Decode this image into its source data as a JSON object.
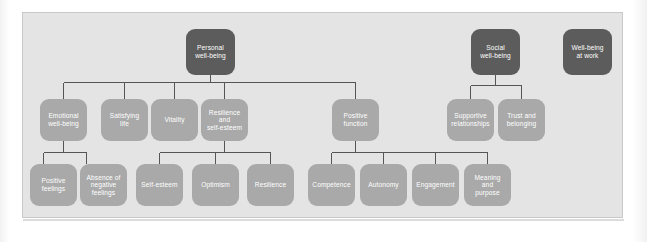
{
  "diagram": {
    "type": "hierarchy-tree",
    "colors": {
      "panel_background": "#e4e4e4",
      "panel_border": "#c9c9c9",
      "node_light": "#a9a9a9",
      "node_dark": "#5c5c5c",
      "node_text": "#ffffff",
      "connector": "#555555",
      "page_background": "#ffffff"
    },
    "nodes": {
      "personal_well_being": "Personal\nwell-being",
      "social_well_being": "Social\nwell-being",
      "well_being_at_work": "Well-being\nat work",
      "emotional_well_being": "Emotional\nwell-being",
      "satisfying_life": "Satisfying\nlife",
      "vitality": "Vitality",
      "resilience_and_self_esteem": "Resilience\nand\nself-esteem",
      "positive_function": "Positive\nfunction",
      "supportive_relationships": "Supportive\nrelationships",
      "trust_and_belonging": "Trust and\nbelonging",
      "positive_feelings": "Positive\nfeelings",
      "absence_of_negative_feelings": "Absence of\nnegative\nfeelings",
      "self_esteem": "Self-esteem",
      "optimism": "Optimism",
      "resilience": "Resilience",
      "competence": "Competence",
      "autonomy": "Autonomy",
      "engagement": "Engagement",
      "meaning_and_purpose": "Meaning\nand\npurpose"
    }
  }
}
